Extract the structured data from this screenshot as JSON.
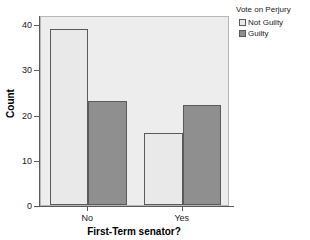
{
  "chart_data": {
    "type": "bar",
    "title": "",
    "subtitle": "",
    "xlabel": "First-Term senator?",
    "ylabel": "Count",
    "categories": [
      "No",
      "Yes"
    ],
    "series": [
      {
        "name": "Not Guilty",
        "values": [
          39,
          16
        ],
        "color": "#e9e9e9"
      },
      {
        "name": "Guilty",
        "values": [
          23,
          22
        ],
        "color": "#8f8f8f"
      }
    ],
    "legend": {
      "title": "Vote on Perjury",
      "position": "top-right",
      "entries": [
        "Not Guilty",
        "Guilty"
      ]
    },
    "ylim": [
      0,
      42
    ],
    "yticks": [
      0,
      10,
      20,
      30,
      40
    ],
    "ytick_labels": [
      "0",
      "10",
      "20",
      "30",
      "40"
    ],
    "xtick_labels": [
      "No",
      "Yes"
    ],
    "grid": false,
    "panel_background": "#ededed",
    "bar_border_color": "#5a5a5a",
    "axis_color": "#5a5a5a"
  },
  "axes": {
    "y_labels": [
      "40",
      "30",
      "20",
      "10",
      "0"
    ],
    "x_labels": [
      "No",
      "Yes"
    ],
    "y_title": "Count",
    "x_title": "First-Term senator?"
  },
  "legend": {
    "title": "Vote on Perjury",
    "items": [
      {
        "label": "Not Guilty"
      },
      {
        "label": "Guilty"
      }
    ]
  }
}
